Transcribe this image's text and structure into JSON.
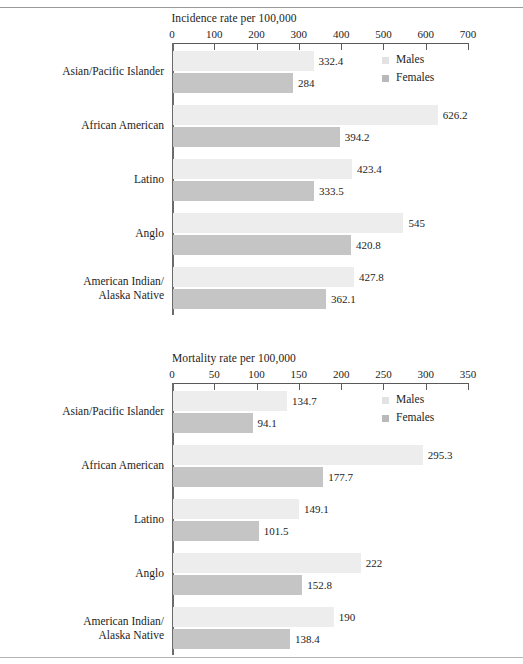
{
  "figure": {
    "rule_top": true,
    "rule_bottom": true
  },
  "legend": {
    "males_label": "Males",
    "females_label": "Females",
    "males_color": "#ededed",
    "females_color": "#c5c5c5"
  },
  "chart_data": [
    {
      "type": "bar",
      "orientation": "horizontal",
      "title": "Incidence rate per 100,000",
      "xlabel": "",
      "ylabel": "",
      "xlim": [
        0,
        700
      ],
      "ticks": [
        0,
        100,
        200,
        300,
        400,
        500,
        600,
        700
      ],
      "tick_labels": [
        "0",
        "100",
        "200",
        "300",
        "400",
        "500",
        "600",
        "700"
      ],
      "grid": false,
      "legend_position": "inside-top-right",
      "categories": [
        "Asian/Pacific Islander",
        "African American",
        "Latino",
        "Anglo",
        "American Indian/\nAlaska Native"
      ],
      "series": [
        {
          "name": "Males",
          "values": [
            332.4,
            626.2,
            423.4,
            545,
            427.8
          ],
          "value_labels": [
            "332.4",
            "626.2",
            "423.4",
            "545",
            "427.8"
          ]
        },
        {
          "name": "Females",
          "values": [
            284,
            394.2,
            333.5,
            420.8,
            362.1
          ],
          "value_labels": [
            "284",
            "394.2",
            "333.5",
            "420.8",
            "362.1"
          ]
        }
      ]
    },
    {
      "type": "bar",
      "orientation": "horizontal",
      "title": "Mortality rate per 100,000",
      "xlabel": "",
      "ylabel": "",
      "xlim": [
        0,
        350
      ],
      "ticks": [
        0,
        50,
        100,
        150,
        200,
        250,
        300,
        350
      ],
      "tick_labels": [
        "0",
        "50",
        "100",
        "150",
        "200",
        "250",
        "300",
        "350"
      ],
      "grid": false,
      "legend_position": "inside-top-right",
      "categories": [
        "Asian/Pacific Islander",
        "African American",
        "Latino",
        "Anglo",
        "American Indian/\nAlaska Native"
      ],
      "series": [
        {
          "name": "Males",
          "values": [
            134.7,
            295.3,
            149.1,
            222,
            190
          ],
          "value_labels": [
            "134.7",
            "295.3",
            "149.1",
            "222",
            "190"
          ]
        },
        {
          "name": "Females",
          "values": [
            94.1,
            177.7,
            101.5,
            152.8,
            138.4
          ],
          "value_labels": [
            "94.1",
            "177.7",
            "101.5",
            "152.8",
            "138.4"
          ]
        }
      ]
    }
  ]
}
